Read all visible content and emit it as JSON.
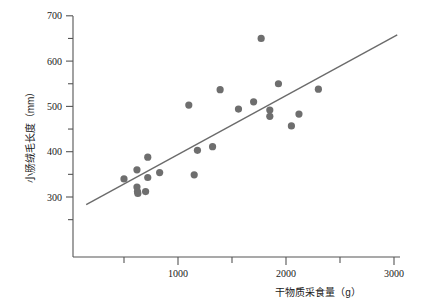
{
  "chart_data": {
    "type": "scatter",
    "title": "",
    "xlabel": "干物质采食量（g）",
    "ylabel": "小肠绒毛长度（mm）",
    "xlim": [
      0,
      3000
    ],
    "ylim": [
      200,
      700
    ],
    "grid": false,
    "legend": null,
    "xticks_major": [
      1000,
      2000,
      3000
    ],
    "xticks_minor": [
      500,
      1500,
      2500
    ],
    "xtick_labels": [
      "1000",
      "2000",
      "3000"
    ],
    "yticks_major": [
      300,
      400,
      500,
      600,
      700
    ],
    "ytick_labels": [
      "300",
      "400",
      "500",
      "600",
      "700"
    ],
    "yticks_minor": [
      250,
      350,
      450,
      550,
      650
    ],
    "marker": {
      "shape": "circle",
      "color": "#6e6e6e",
      "size": 6
    },
    "points": [
      {
        "x": 500,
        "y": 340
      },
      {
        "x": 620,
        "y": 360
      },
      {
        "x": 620,
        "y": 322
      },
      {
        "x": 625,
        "y": 312
      },
      {
        "x": 628,
        "y": 308
      },
      {
        "x": 700,
        "y": 312
      },
      {
        "x": 720,
        "y": 388
      },
      {
        "x": 720,
        "y": 343
      },
      {
        "x": 830,
        "y": 354
      },
      {
        "x": 1100,
        "y": 503
      },
      {
        "x": 1150,
        "y": 349
      },
      {
        "x": 1180,
        "y": 403
      },
      {
        "x": 1320,
        "y": 411
      },
      {
        "x": 1390,
        "y": 537
      },
      {
        "x": 1560,
        "y": 494
      },
      {
        "x": 1700,
        "y": 510
      },
      {
        "x": 1770,
        "y": 650
      },
      {
        "x": 1850,
        "y": 492
      },
      {
        "x": 1850,
        "y": 478
      },
      {
        "x": 1930,
        "y": 550
      },
      {
        "x": 2050,
        "y": 457
      },
      {
        "x": 2120,
        "y": 483
      },
      {
        "x": 2300,
        "y": 538
      }
    ],
    "trendline": {
      "type": "linear",
      "x_start": 150,
      "y_start": 283,
      "x_end": 3030,
      "y_end": 658
    }
  },
  "axis": {
    "y_title": "小肠绒毛长度（mm）",
    "x_title": "干物质采食量（g）"
  }
}
